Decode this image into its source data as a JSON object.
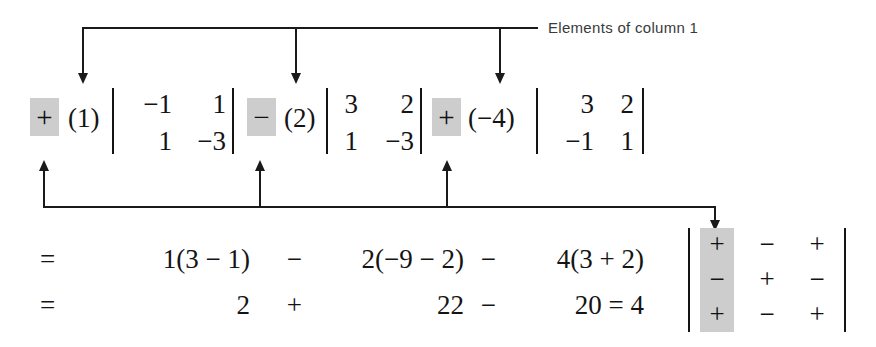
{
  "figure": {
    "caption": "Elements of column 1",
    "highlight_color": "#cdcdcd",
    "ink_color": "#141414",
    "background": "#ffffff"
  },
  "expansion": {
    "terms": [
      {
        "sign": "+",
        "coefficient": "(1)",
        "minor": {
          "r1c1": "−1",
          "r1c2": "1",
          "r2c1": "1",
          "r2c2": "−3"
        }
      },
      {
        "sign": "−",
        "coefficient": "(2)",
        "minor": {
          "r1c1": "3",
          "r1c2": "2",
          "r2c1": "1",
          "r2c2": "−3"
        }
      },
      {
        "sign": "+",
        "coefficient": "(−4)",
        "minor": {
          "r1c1": "3",
          "r1c2": "2",
          "r2c1": "−1",
          "r2c2": "1"
        }
      }
    ]
  },
  "result_lines": [
    {
      "equals": "=",
      "parts": [
        "1(3 − 1)",
        "2(−9 − 2)",
        "4(3 + 2)"
      ],
      "operators": [
        "−",
        "−"
      ]
    },
    {
      "equals": "=",
      "parts": [
        "2",
        "22",
        "20 = 4"
      ],
      "operators": [
        "+",
        "−"
      ]
    }
  ],
  "sign_matrix": {
    "rows": [
      [
        "+",
        "−",
        "+"
      ],
      [
        "−",
        "+",
        "−"
      ],
      [
        "+",
        "−",
        "+"
      ]
    ],
    "highlighted_column": 1
  }
}
